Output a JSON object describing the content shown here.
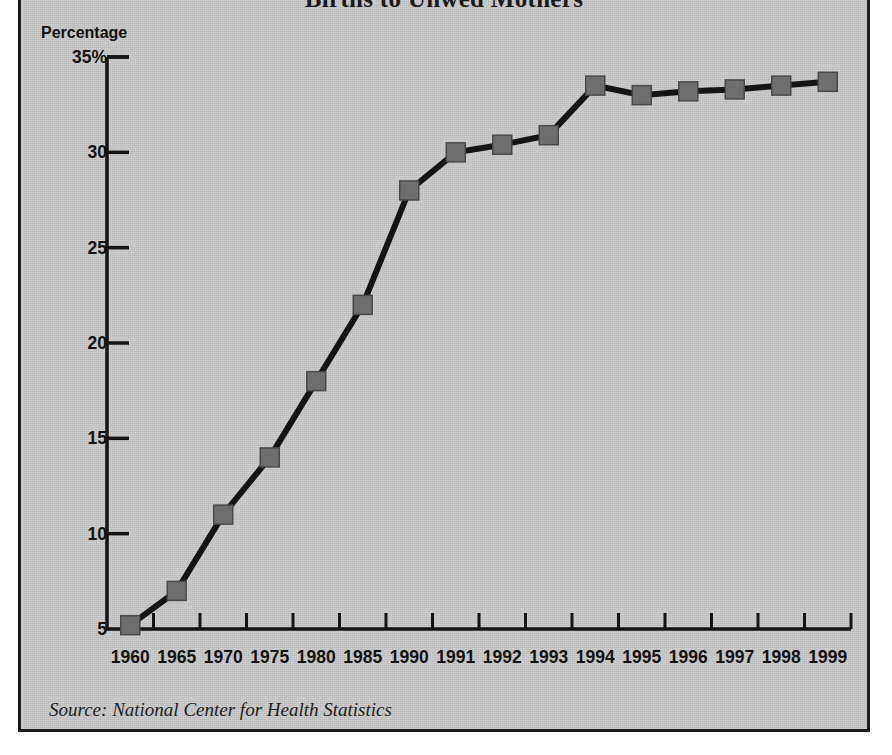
{
  "panel": {
    "background_color": "#c9c9c9",
    "border_color": "#1b1b1b"
  },
  "title": "Births to Unwed Mothers",
  "y_axis_label": "Percentage",
  "source_note": "Source: National Center for Health Statistics",
  "chart_data": {
    "type": "line",
    "title": "Births to Unwed Mothers",
    "xlabel": "",
    "ylabel": "Percentage",
    "ylim": [
      5,
      35
    ],
    "yticks": [
      35,
      30,
      25,
      20,
      15,
      10,
      5
    ],
    "ytick_labels": [
      "35%",
      "30",
      "25",
      "20",
      "15",
      "10",
      "5"
    ],
    "grid": false,
    "legend": "none",
    "marker": "square",
    "line_color": "#141414",
    "marker_color": "#6e6e6e",
    "marker_edge_color": "#4a4a4a",
    "categories": [
      "1960",
      "1965",
      "1970",
      "1975",
      "1980",
      "1985",
      "1990",
      "1991",
      "1992",
      "1993",
      "1994",
      "1995",
      "1996",
      "1997",
      "1998",
      "1999"
    ],
    "values": [
      5.2,
      7.0,
      11.0,
      14.0,
      18.0,
      22.0,
      28.0,
      30.0,
      30.4,
      30.9,
      33.5,
      33.0,
      33.2,
      33.3,
      33.5,
      33.7
    ]
  }
}
